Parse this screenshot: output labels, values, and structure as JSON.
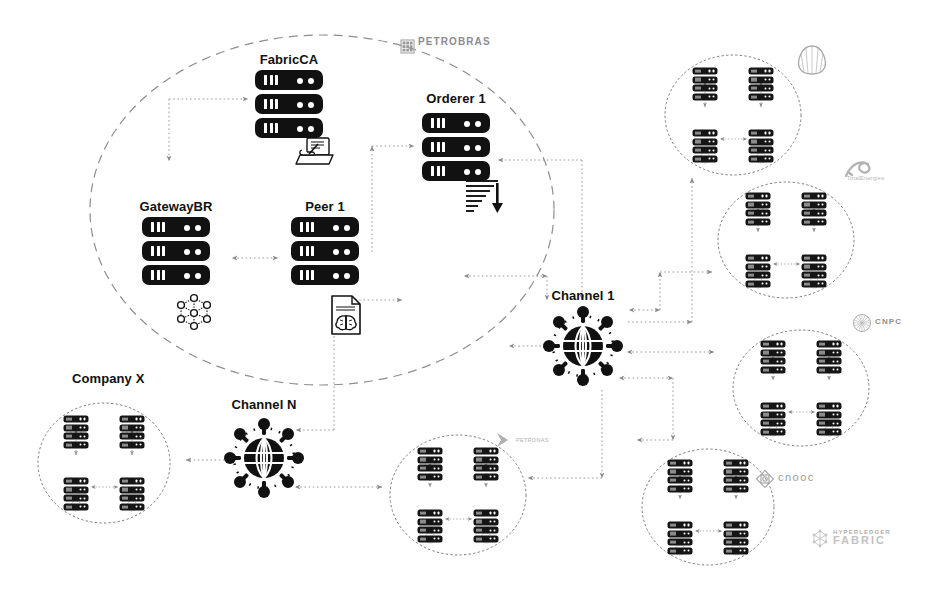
{
  "diagram": {
    "background_color": "#ffffff",
    "ink_color": "#111111",
    "muted_color": "#888888"
  },
  "org_boundary": {
    "name": "Petrobras organization boundary",
    "style": "dashed-ellipse",
    "cx": 322,
    "cy": 210,
    "rx": 232,
    "ry": 175
  },
  "nodes": [
    {
      "id": "fabric-ca",
      "label": "FabricCA",
      "x": 289,
      "y": 60,
      "stack_top": 77,
      "icon": "certificate-sign-icon",
      "icon_x": 311,
      "icon_y": 142
    },
    {
      "id": "orderer-1",
      "label": "Orderer 1",
      "x": 456,
      "y": 99,
      "stack_top": 116,
      "icon": "ordering-sort-icon",
      "icon_x": 484,
      "icon_y": 181
    },
    {
      "id": "gateway-br",
      "label": "GatewayBR",
      "x": 176,
      "y": 206,
      "stack_top": 223,
      "icon": "mesh-network-icon",
      "icon_x": 194,
      "icon_y": 296
    },
    {
      "id": "peer-1",
      "label": "Peer 1",
      "x": 325,
      "y": 206,
      "stack_top": 223,
      "icon": "chaincode-brain-icon",
      "icon_x": 344,
      "icon_y": 296
    }
  ],
  "channels": [
    {
      "id": "channel-1",
      "label": "Channel 1",
      "x": 583,
      "y": 296,
      "hub_cx": 583,
      "hub_cy": 346
    },
    {
      "id": "channel-n",
      "label": "Channel N",
      "x": 264,
      "y": 405,
      "hub_cx": 264,
      "hub_cy": 458
    }
  ],
  "organizations": [
    {
      "id": "org-company-x",
      "label": "Company X",
      "label_x": 72,
      "label_y": 371,
      "cx": 104,
      "cy": 463,
      "rx": 66,
      "ry": 60,
      "peers": 4
    },
    {
      "id": "org-shell",
      "label": "",
      "cx": 733,
      "cy": 115,
      "rx": 68,
      "ry": 60,
      "peers": 4
    },
    {
      "id": "org-totalenergies",
      "label": "",
      "cx": 786,
      "cy": 240,
      "rx": 68,
      "ry": 58,
      "peers": 4
    },
    {
      "id": "org-cnpc",
      "label": "",
      "cx": 801,
      "cy": 388,
      "rx": 68,
      "ry": 58,
      "peers": 4
    },
    {
      "id": "org-cnooc",
      "label": "",
      "cx": 708,
      "cy": 507,
      "rx": 66,
      "ry": 58,
      "peers": 4
    },
    {
      "id": "org-unnamed-bottom",
      "label": "",
      "cx": 458,
      "cy": 495,
      "rx": 68,
      "ry": 60,
      "peers": 4
    }
  ],
  "brands": [
    {
      "id": "petrobras",
      "name": "PETROBRAS",
      "mark": "grid-square-logo",
      "x": 398,
      "y": 37,
      "font_size": 10,
      "color": "#8d8d8d"
    },
    {
      "id": "shell",
      "name": "",
      "mark": "scallop-shell-logo",
      "x": 798,
      "y": 42,
      "font_size": 9,
      "color": "#9a9a9a"
    },
    {
      "id": "totalenergies",
      "name": "TotalEnergies",
      "mark": "ribbon-logo",
      "x": 845,
      "y": 158,
      "font_size": 5.5,
      "color": "#a8a8a8"
    },
    {
      "id": "cnpc",
      "name": "CNPC",
      "mark": "sunburst-circle-logo",
      "x": 855,
      "y": 314,
      "font_size": 8,
      "color": "#8d8d8d"
    },
    {
      "id": "cnooc",
      "name": "cnooc",
      "mark": "diamond-flower-logo",
      "x": 758,
      "y": 469,
      "font_size": 11,
      "color": "#9c9c9c"
    },
    {
      "id": "petronas",
      "name": "PETRONAS",
      "mark": "chevron-logo",
      "x": 496,
      "y": 434,
      "font_size": 5.5,
      "color": "#a8a8a8"
    },
    {
      "id": "hyperledger-fabric",
      "name": "HYPERLEDGER",
      "sub": "FABRIC",
      "mark": "hyperledger-logo",
      "x": 812,
      "y": 528,
      "font_size": 6,
      "color": "#aeaeae"
    }
  ],
  "connections": [
    {
      "from": "fabric-ca",
      "to": "gateway-br",
      "style": "dotted"
    },
    {
      "from": "gateway-br",
      "to": "peer-1",
      "style": "dotted-bidirectional"
    },
    {
      "from": "peer-1",
      "to": "orderer-1",
      "style": "dotted"
    },
    {
      "from": "orderer-1",
      "to": "channel-1",
      "style": "dotted"
    },
    {
      "from": "peer-1",
      "to": "channel-1",
      "style": "dotted"
    },
    {
      "from": "channel-1",
      "to": "org-shell",
      "style": "dotted"
    },
    {
      "from": "channel-1",
      "to": "org-totalenergies",
      "style": "dotted"
    },
    {
      "from": "channel-1",
      "to": "org-cnpc",
      "style": "dotted"
    },
    {
      "from": "channel-1",
      "to": "org-cnooc",
      "style": "dotted"
    },
    {
      "from": "channel-1",
      "to": "org-unnamed-bottom",
      "style": "dotted"
    },
    {
      "from": "channel-n",
      "to": "org-company-x",
      "style": "dotted"
    },
    {
      "from": "channel-n",
      "to": "peer-1",
      "style": "dotted"
    },
    {
      "from": "channel-n",
      "to": "org-unnamed-bottom",
      "style": "dotted"
    }
  ]
}
